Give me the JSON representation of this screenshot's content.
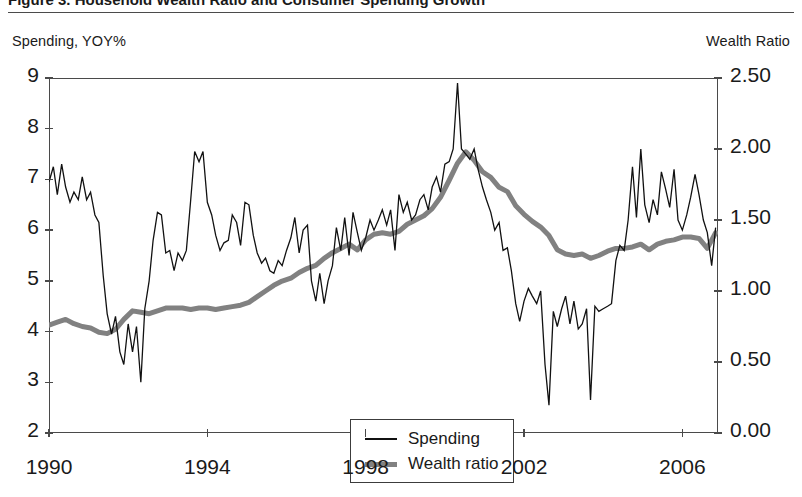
{
  "figure": {
    "title_clipped": "Figure 3.   Household Wealth Ratio and Consumer Spending Growth",
    "left_axis_caption": "Spending, YOY%",
    "right_axis_caption": "Wealth Ratio"
  },
  "legend": {
    "position": "inside-bottom-center",
    "entries": [
      {
        "label": "Spending",
        "icon": "thin-line-swatch",
        "color": "#111111"
      },
      {
        "label": "Wealth ratio",
        "icon": "thick-line-swatch",
        "color": "#818181"
      }
    ]
  },
  "chart_data": {
    "type": "line",
    "title": "Household Wealth Ratio and Consumer Spending Growth",
    "xlabel": "",
    "ylabel": "Spending, YOY%",
    "y2label": "Wealth Ratio",
    "grid": false,
    "xlim": [
      1990.0,
      2006.9
    ],
    "ylim": [
      2,
      9
    ],
    "y2lim": [
      0.0,
      2.5
    ],
    "xticks": [
      1990,
      1994,
      1998,
      2002,
      2006
    ],
    "xticklabels": [
      "1990",
      "1994",
      "1998",
      "2002",
      "2006"
    ],
    "yticks": [
      2,
      3,
      4,
      5,
      6,
      7,
      8,
      9
    ],
    "yticklabels": [
      "2",
      "3",
      "4",
      "5",
      "6",
      "7",
      "8",
      "9"
    ],
    "y2ticks": [
      0.0,
      0.5,
      1.0,
      1.5,
      2.0,
      2.5
    ],
    "y2ticklabels": [
      "0.00",
      "0.50",
      "1.00",
      "1.50",
      "2.00",
      "2.50"
    ],
    "series": [
      {
        "name": "Spending",
        "axis": "left",
        "color": "#111111",
        "linewidth": 1.3,
        "x": [
          1990.0,
          1990.11,
          1990.21,
          1990.32,
          1990.42,
          1990.53,
          1990.63,
          1990.74,
          1990.84,
          1990.95,
          1991.05,
          1991.16,
          1991.26,
          1991.37,
          1991.47,
          1991.58,
          1991.68,
          1991.79,
          1991.89,
          1992.0,
          1992.11,
          1992.21,
          1992.32,
          1992.42,
          1992.53,
          1992.63,
          1992.74,
          1992.84,
          1992.95,
          1993.05,
          1993.16,
          1993.26,
          1993.37,
          1993.47,
          1993.58,
          1993.68,
          1993.79,
          1993.89,
          1994.0,
          1994.11,
          1994.21,
          1994.32,
          1994.42,
          1994.53,
          1994.63,
          1994.74,
          1994.84,
          1994.95,
          1995.05,
          1995.16,
          1995.26,
          1995.37,
          1995.47,
          1995.58,
          1995.68,
          1995.79,
          1995.89,
          1996.0,
          1996.11,
          1996.21,
          1996.32,
          1996.42,
          1996.53,
          1996.63,
          1996.74,
          1996.84,
          1996.95,
          1997.05,
          1997.16,
          1997.26,
          1997.37,
          1997.47,
          1997.58,
          1997.68,
          1997.79,
          1997.89,
          1998.0,
          1998.11,
          1998.21,
          1998.32,
          1998.42,
          1998.53,
          1998.63,
          1998.74,
          1998.84,
          1998.95,
          1999.05,
          1999.16,
          1999.26,
          1999.37,
          1999.47,
          1999.58,
          1999.68,
          1999.79,
          1999.89,
          2000.0,
          2000.11,
          2000.21,
          2000.32,
          2000.42,
          2000.53,
          2000.63,
          2000.74,
          2000.84,
          2000.95,
          2001.05,
          2001.16,
          2001.26,
          2001.37,
          2001.47,
          2001.58,
          2001.68,
          2001.79,
          2001.89,
          2002.0,
          2002.11,
          2002.21,
          2002.32,
          2002.42,
          2002.53,
          2002.63,
          2002.74,
          2002.84,
          2002.95,
          2003.05,
          2003.16,
          2003.26,
          2003.37,
          2003.47,
          2003.58,
          2003.68,
          2003.79,
          2003.89,
          2004.0,
          2004.11,
          2004.21,
          2004.32,
          2004.42,
          2004.53,
          2004.63,
          2004.74,
          2004.84,
          2004.95,
          2005.05,
          2005.16,
          2005.26,
          2005.37,
          2005.47,
          2005.58,
          2005.68,
          2005.79,
          2005.89,
          2006.0,
          2006.11,
          2006.21,
          2006.32,
          2006.42,
          2006.53,
          2006.63,
          2006.74,
          2006.84
        ],
        "y": [
          6.95,
          7.25,
          6.7,
          7.3,
          6.85,
          6.55,
          6.75,
          6.6,
          7.05,
          6.6,
          6.75,
          6.3,
          6.15,
          5.1,
          4.35,
          3.95,
          4.3,
          3.6,
          3.35,
          4.15,
          3.6,
          4.1,
          3.0,
          4.45,
          5.0,
          5.8,
          6.35,
          6.3,
          5.55,
          5.6,
          5.2,
          5.55,
          5.4,
          5.6,
          6.6,
          7.55,
          7.35,
          7.55,
          6.55,
          6.3,
          5.9,
          5.6,
          5.75,
          5.8,
          6.3,
          6.15,
          5.7,
          6.55,
          6.5,
          5.9,
          5.55,
          5.35,
          5.45,
          5.2,
          5.15,
          5.4,
          5.3,
          5.6,
          5.85,
          6.25,
          5.55,
          6.0,
          6.1,
          5.0,
          4.6,
          5.15,
          4.55,
          5.0,
          5.3,
          6.05,
          5.6,
          6.25,
          5.5,
          6.35,
          5.95,
          5.6,
          5.85,
          6.2,
          6.0,
          6.2,
          6.4,
          6.1,
          6.4,
          5.6,
          6.7,
          6.35,
          6.55,
          6.2,
          6.3,
          6.6,
          6.7,
          6.4,
          6.85,
          7.05,
          6.75,
          7.3,
          7.35,
          7.6,
          8.9,
          7.6,
          7.5,
          7.4,
          7.6,
          7.2,
          6.85,
          6.6,
          6.35,
          6.0,
          6.15,
          5.6,
          5.65,
          5.2,
          4.55,
          4.2,
          4.6,
          4.85,
          4.7,
          4.55,
          4.8,
          3.35,
          2.55,
          4.4,
          4.1,
          4.45,
          4.7,
          4.15,
          4.6,
          4.05,
          4.15,
          4.45,
          2.65,
          4.5,
          4.4,
          4.45,
          4.5,
          4.55,
          5.4,
          5.7,
          5.6,
          6.2,
          7.25,
          6.25,
          7.6,
          6.5,
          6.15,
          6.6,
          6.3,
          7.15,
          6.8,
          6.45,
          7.2,
          6.2,
          6.0,
          6.3,
          6.65,
          7.1,
          6.7,
          6.2,
          5.95,
          5.3,
          6.05
        ]
      },
      {
        "name": "Wealth ratio",
        "axis": "right",
        "color": "#818181",
        "linewidth": 5.0,
        "x": [
          1990.0,
          1990.21,
          1990.42,
          1990.63,
          1990.84,
          1991.05,
          1991.26,
          1991.47,
          1991.68,
          1991.89,
          1992.11,
          1992.32,
          1992.53,
          1992.74,
          1992.95,
          1993.16,
          1993.37,
          1993.58,
          1993.79,
          1994.0,
          1994.21,
          1994.42,
          1994.63,
          1994.84,
          1995.05,
          1995.26,
          1995.47,
          1995.68,
          1995.89,
          1996.11,
          1996.32,
          1996.53,
          1996.74,
          1996.95,
          1997.16,
          1997.37,
          1997.58,
          1997.79,
          1998.0,
          1998.21,
          1998.42,
          1998.63,
          1998.84,
          1999.05,
          1999.26,
          1999.47,
          1999.68,
          1999.89,
          2000.11,
          2000.32,
          2000.53,
          2000.74,
          2000.95,
          2001.16,
          2001.37,
          2001.58,
          2001.79,
          2002.0,
          2002.21,
          2002.42,
          2002.63,
          2002.84,
          2003.05,
          2003.26,
          2003.47,
          2003.68,
          2003.89,
          2004.11,
          2004.32,
          2004.53,
          2004.74,
          2004.95,
          2005.16,
          2005.37,
          2005.58,
          2005.79,
          2006.0,
          2006.21,
          2006.42,
          2006.63,
          2006.84
        ],
        "y": [
          0.76,
          0.78,
          0.8,
          0.77,
          0.75,
          0.74,
          0.71,
          0.7,
          0.73,
          0.8,
          0.86,
          0.85,
          0.84,
          0.86,
          0.88,
          0.88,
          0.88,
          0.87,
          0.88,
          0.88,
          0.87,
          0.88,
          0.89,
          0.9,
          0.92,
          0.96,
          1.0,
          1.04,
          1.07,
          1.09,
          1.13,
          1.16,
          1.18,
          1.23,
          1.27,
          1.3,
          1.33,
          1.29,
          1.36,
          1.4,
          1.41,
          1.4,
          1.42,
          1.47,
          1.5,
          1.53,
          1.58,
          1.66,
          1.78,
          1.9,
          1.98,
          1.92,
          1.84,
          1.8,
          1.73,
          1.7,
          1.6,
          1.54,
          1.49,
          1.45,
          1.39,
          1.29,
          1.26,
          1.25,
          1.26,
          1.23,
          1.25,
          1.28,
          1.3,
          1.3,
          1.31,
          1.33,
          1.29,
          1.33,
          1.35,
          1.36,
          1.38,
          1.38,
          1.37,
          1.3,
          1.41
        ]
      }
    ]
  },
  "yaxis_left_labels": [
    "9",
    "8",
    "7",
    "6",
    "5",
    "4",
    "3",
    "2"
  ],
  "yaxis_right_labels": [
    "2.50",
    "2.00",
    "1.50",
    "1.00",
    "0.50",
    "0.00"
  ],
  "xaxis_labels": [
    "1990",
    "1994",
    "1998",
    "2002",
    "2006"
  ]
}
